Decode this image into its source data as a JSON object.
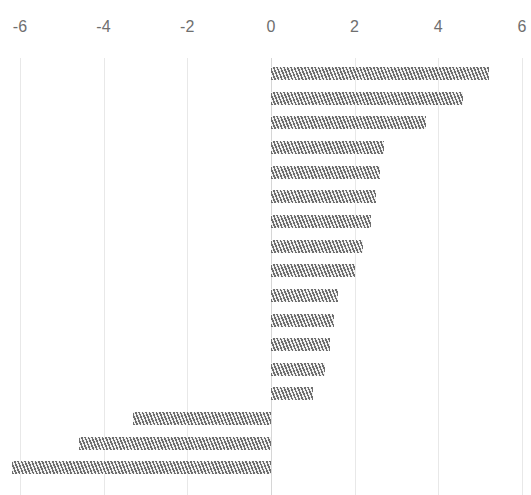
{
  "chart_data": {
    "type": "bar",
    "orientation": "horizontal",
    "title": "",
    "subtitle": "",
    "xlabel": "",
    "ylabel": "",
    "xlim": [
      -6,
      6
    ],
    "grid": true,
    "legend": "none",
    "axis_position": "top",
    "tick_labels": [
      "-6",
      "-4",
      "-2",
      "0",
      "2",
      "4",
      "6"
    ],
    "ticks": [
      -6,
      -4,
      -2,
      0,
      2,
      4,
      6
    ],
    "categories": [
      "",
      "",
      "",
      "",
      "",
      "",
      "",
      "",
      "",
      "",
      "",
      "",
      "",
      "",
      "",
      "",
      ""
    ],
    "values": [
      5.2,
      4.6,
      3.7,
      2.7,
      2.6,
      2.5,
      2.4,
      2.2,
      2.0,
      1.6,
      1.5,
      1.4,
      1.3,
      1.0,
      -3.3,
      -4.6,
      -6.2
    ],
    "bar_fill_color": "#787878",
    "bar_hatch": "diagonal-stripes",
    "gridline_color": "#e8e8e8",
    "zero_line_color": "#d6d6d6",
    "tick_label_color": "#6f6f6f",
    "background_color": "#ffffff"
  }
}
